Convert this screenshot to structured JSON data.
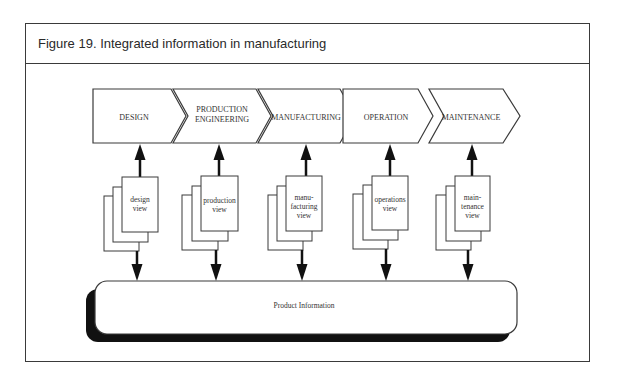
{
  "figure": {
    "title": "Figure 19. Integrated information in manufacturing"
  },
  "diagram": {
    "stages": [
      {
        "line1": "DESIGN",
        "line2": ""
      },
      {
        "line1": "PRODUCTION",
        "line2": "ENGINEERING"
      },
      {
        "line1": "MANUFACTURING",
        "line2": ""
      },
      {
        "line1": "OPERATION",
        "line2": ""
      },
      {
        "line1": "MAINTENANCE",
        "line2": ""
      }
    ],
    "views": [
      {
        "lines": [
          "design",
          "view"
        ]
      },
      {
        "lines": [
          "production",
          "view"
        ]
      },
      {
        "lines": [
          "manu-",
          "facturing",
          "view"
        ]
      },
      {
        "lines": [
          "operations",
          "view"
        ]
      },
      {
        "lines": [
          "main-",
          "tenance",
          "view"
        ]
      }
    ],
    "repository": {
      "label": "Product Information"
    },
    "colors": {
      "stroke": "#3a3a3a",
      "arrow": "#111111",
      "shadow": "#111111",
      "fill": "#ffffff"
    }
  }
}
